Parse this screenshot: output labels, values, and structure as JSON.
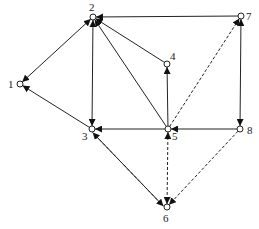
{
  "diagram": {
    "type": "directed-graph",
    "nodes": [
      {
        "id": "1",
        "label": "1",
        "x": 20,
        "y": 84,
        "lx": 8,
        "ly": 88
      },
      {
        "id": "2",
        "label": "2",
        "x": 93,
        "y": 17,
        "lx": 89,
        "ly": 11
      },
      {
        "id": "3",
        "label": "3",
        "x": 92,
        "y": 129,
        "lx": 82,
        "ly": 140
      },
      {
        "id": "4",
        "label": "4",
        "x": 167,
        "y": 64,
        "lx": 170,
        "ly": 60
      },
      {
        "id": "5",
        "label": "5",
        "x": 168,
        "y": 129,
        "lx": 172,
        "ly": 140
      },
      {
        "id": "6",
        "label": "6",
        "x": 167,
        "y": 207,
        "lx": 163,
        "ly": 222
      },
      {
        "id": "7",
        "label": "7",
        "x": 241,
        "y": 16,
        "lx": 246,
        "ly": 20
      },
      {
        "id": "8",
        "label": "8",
        "x": 240,
        "y": 129,
        "lx": 247,
        "ly": 134
      }
    ],
    "edges": [
      {
        "from": "1",
        "to": "2",
        "style": "solid",
        "bidirectional": true
      },
      {
        "from": "3",
        "to": "1",
        "style": "solid",
        "bidirectional": false
      },
      {
        "from": "3",
        "to": "2",
        "style": "solid",
        "bidirectional": true
      },
      {
        "from": "7",
        "to": "2",
        "style": "solid",
        "bidirectional": false
      },
      {
        "from": "4",
        "to": "2",
        "style": "solid",
        "bidirectional": false
      },
      {
        "from": "5",
        "to": "2",
        "style": "solid",
        "bidirectional": false
      },
      {
        "from": "5",
        "to": "4",
        "style": "solid",
        "bidirectional": false
      },
      {
        "from": "5",
        "to": "3",
        "style": "solid",
        "bidirectional": false
      },
      {
        "from": "8",
        "to": "5",
        "style": "solid",
        "bidirectional": false
      },
      {
        "from": "7",
        "to": "8",
        "style": "solid",
        "bidirectional": true
      },
      {
        "from": "5",
        "to": "7",
        "style": "dashed",
        "bidirectional": false
      },
      {
        "from": "6",
        "to": "3",
        "style": "solid",
        "bidirectional": false,
        "offset": -2
      },
      {
        "from": "3",
        "to": "6",
        "style": "dashed",
        "bidirectional": false,
        "offset": 2
      },
      {
        "from": "5",
        "to": "6",
        "style": "dashed",
        "bidirectional": true
      },
      {
        "from": "8",
        "to": "6",
        "style": "dashed",
        "bidirectional": false
      }
    ],
    "colors": {
      "stroke": "#222222",
      "node_fill": "#ffffff"
    }
  }
}
